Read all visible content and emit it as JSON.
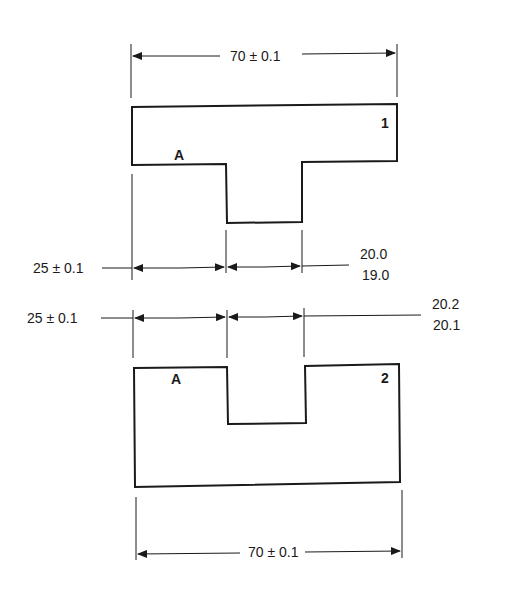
{
  "diagram": {
    "part1": {
      "number": "1",
      "face_label": "A",
      "overall_width": "70 ± 0.1",
      "left_offset": "25 ± 0.1",
      "tab_width_upper": "20.0",
      "tab_width_lower": "19.0"
    },
    "part2": {
      "number": "2",
      "face_label": "A",
      "overall_width": "70 ± 0.1",
      "left_offset": "25 ± 0.1",
      "slot_width_upper": "20.2",
      "slot_width_lower": "20.1"
    }
  }
}
